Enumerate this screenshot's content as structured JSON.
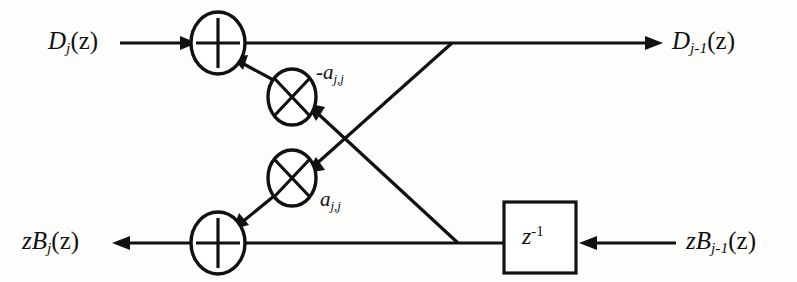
{
  "diagram": {
    "type": "signal-flow-graph",
    "background_color": "#fdfdfc",
    "line_color": "#111111",
    "labels": {
      "input_top": {
        "base": "D",
        "sub": "j",
        "arg": "(z)",
        "text": "D_j(z)"
      },
      "output_top": {
        "base": "D",
        "sub": "j-1",
        "arg": "(z)",
        "text": "D_{j-1}(z)"
      },
      "output_bottom": {
        "prefix": "z",
        "base": "B",
        "sub": "j",
        "arg": "(z)",
        "text": "zB_j(z)"
      },
      "input_bottom": {
        "prefix": "z",
        "base": "B",
        "sub": "j-1",
        "arg": "(z)",
        "text": "zB_{j-1}(z)"
      },
      "coefficient_negative": {
        "base": "-a",
        "sub": "j,j",
        "text": "-a_{j,j}"
      },
      "coefficient_positive": {
        "base": "a",
        "sub": "j,j",
        "text": "a_{j,j}"
      },
      "delay_block": {
        "base": "z",
        "sup": "-1",
        "text": "z^{-1}"
      }
    },
    "nodes": [
      {
        "id": "adder-top",
        "symbol": "plus",
        "cx": 218,
        "cy": 43,
        "r": 21
      },
      {
        "id": "multiplier-upper",
        "symbol": "times",
        "cx": 292,
        "cy": 97,
        "r": 18
      },
      {
        "id": "multiplier-lower",
        "symbol": "times",
        "cx": 292,
        "cy": 178,
        "r": 18
      },
      {
        "id": "adder-bottom",
        "symbol": "plus",
        "cx": 218,
        "cy": 243,
        "r": 21
      },
      {
        "id": "delay-block",
        "symbol": "rect",
        "x": 504,
        "y": 202,
        "w": 72,
        "h": 71
      }
    ],
    "edges": [
      {
        "id": "in-top-to-adder",
        "from": "input_top",
        "to": "adder-top",
        "arrow": true
      },
      {
        "id": "adder-top-to-out",
        "from": "adder-top",
        "to": "output_top",
        "arrow": true
      },
      {
        "id": "top-tap-to-mult-lower",
        "from": "top-wire-junction",
        "to": "multiplier-lower",
        "arrow": true
      },
      {
        "id": "mult-upper-to-adder-top",
        "from": "multiplier-upper",
        "to": "adder-top",
        "arrow": true
      },
      {
        "id": "bottom-tap-to-mult-upper",
        "from": "bottom-wire-junction",
        "to": "multiplier-upper",
        "arrow": true
      },
      {
        "id": "mult-lower-to-adder-bottom",
        "from": "multiplier-lower",
        "to": "adder-bottom",
        "arrow": true
      },
      {
        "id": "in-bottom-to-delay",
        "from": "input_bottom",
        "to": "delay-block",
        "arrow": true
      },
      {
        "id": "delay-to-adder-bottom",
        "from": "delay-block",
        "to": "adder-bottom",
        "arrow": false
      },
      {
        "id": "adder-bottom-to-out",
        "from": "adder-bottom",
        "to": "output_bottom",
        "arrow": true
      }
    ]
  }
}
